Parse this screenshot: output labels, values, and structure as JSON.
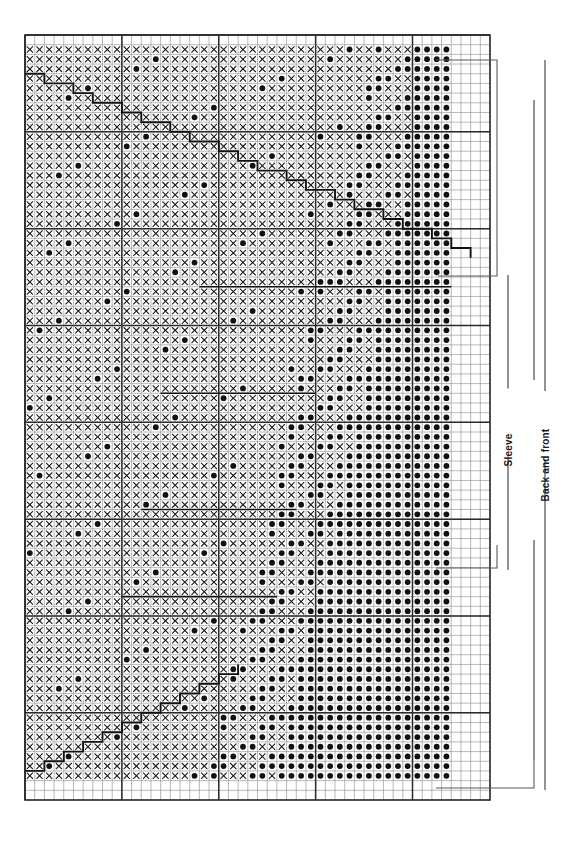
{
  "chart_title": "",
  "chart_data": {
    "type": "heatmap",
    "xlabel": "",
    "ylabel": "",
    "grid": true,
    "legend_position": "right",
    "symbols": {
      "x": "cross-stitch",
      "o": "filled-dot",
      "blank": "empty"
    },
    "columns": 48,
    "rows": 76,
    "cell_px": 9.7,
    "origin": {
      "x": 25,
      "y": 35
    },
    "heavy_line_every": 10,
    "annotations": [
      {
        "name": "sleeve",
        "label": "Sleeve",
        "orientation": "vertical",
        "x": 508,
        "y_top": 275,
        "y_bottom": 570
      },
      {
        "name": "back-and-front",
        "label": "Back and front",
        "orientation": "vertical",
        "x": 545,
        "y_top": 60,
        "y_bottom": 790
      }
    ],
    "pattern_note": "Two-colour stranded motif: dense X field at left, filled-dot motif column bands at right, stepped diagonal boundary line.",
    "boundary_line": "stepped-diagonal"
  },
  "labels": {
    "sleeve": "Sleeve",
    "back_and_front": "Back and front"
  },
  "grid": {
    "left": 25,
    "top": 35,
    "right": 490,
    "bottom": 800,
    "cols": 48,
    "rows": 79
  }
}
